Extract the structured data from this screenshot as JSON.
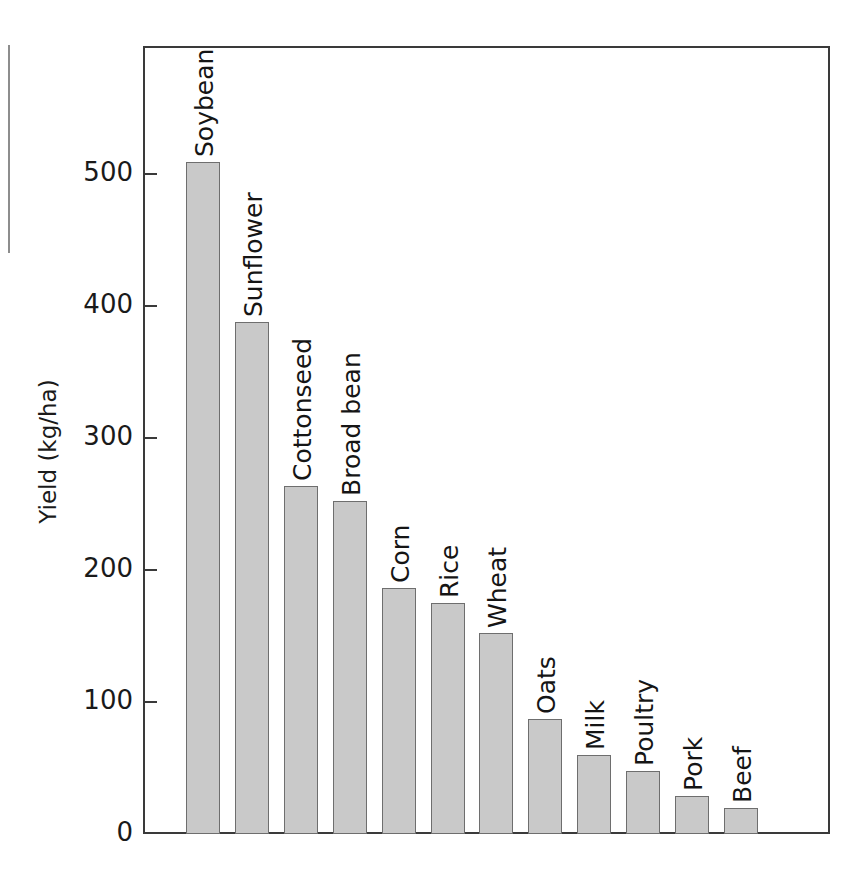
{
  "chart_data": {
    "type": "bar",
    "title": "",
    "subtitle": "",
    "xlabel": "",
    "ylabel": "Yield (kg/ha)",
    "ylim": [
      0,
      580
    ],
    "yticks": [
      0,
      100,
      200,
      300,
      400,
      500
    ],
    "ytick_labels": [
      "0",
      "100",
      "200",
      "300",
      "400",
      "500"
    ],
    "grid": false,
    "legend": null,
    "orientation": "vertical",
    "categories": [
      "Soybean",
      "Sunflower",
      "Cottonseed",
      "Broad bean",
      "Corn",
      "Rice",
      "Wheat",
      "Oats",
      "Milk",
      "Poultry",
      "Pork",
      "Beef"
    ],
    "values": [
      509,
      388,
      264,
      252,
      186,
      175,
      152,
      87,
      60,
      48,
      29,
      20
    ],
    "bar_color": "#c9c9c9",
    "bar_edge_color": "#6e6e6e",
    "axis_color": "#3a3a3a",
    "text_color": "#151515",
    "background_color": "#ffffff",
    "label_orientation": "vertical-above-bar"
  },
  "figure": {
    "page_artifact": "page-edge-line"
  }
}
